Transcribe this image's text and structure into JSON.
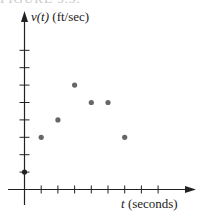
{
  "figure": {
    "cut_text": "FIGURE 3.3.",
    "y_label_var": "v(t)",
    "y_label_unit": "(ft/sec)",
    "x_label_var": "t",
    "x_label_unit": "(seconds)",
    "colors": {
      "axis": "#222222",
      "point": "#666666"
    }
  },
  "chart_data": {
    "type": "scatter",
    "title": "",
    "xlabel": "t (seconds)",
    "ylabel": "v(t) (ft/sec)",
    "x": [
      0,
      1,
      2,
      3,
      4,
      5,
      6
    ],
    "y": [
      1,
      3,
      4,
      6,
      5,
      5,
      3
    ],
    "xlim": [
      0,
      8
    ],
    "ylim": [
      0,
      8
    ],
    "x_ticks": [
      1,
      2,
      3,
      4,
      5,
      6,
      7,
      8
    ],
    "y_ticks": [
      1,
      2,
      3,
      4,
      5,
      6,
      7,
      8
    ],
    "tick_labels_shown": false,
    "grid": false,
    "legend": null
  }
}
